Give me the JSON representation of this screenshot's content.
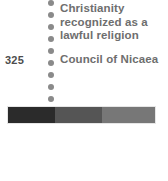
{
  "figure": {
    "type": "timeline-fragment",
    "background_color": "#ffffff",
    "width": 168,
    "height": 181
  },
  "axis": {
    "name": "dotted-timeline-axis",
    "dot_color": "#8a8a8a",
    "dot_count": 10,
    "dot_spacing_px": 12,
    "x_px": 48,
    "orientation": "vertical"
  },
  "events": [
    {
      "year": "",
      "text": "",
      "clipped": true,
      "note": "top line cut off by crop"
    },
    {
      "year": "",
      "text": "Christianity recognized as a lawful religion",
      "lines": [
        "Christianity",
        "recognized as a",
        "lawful religion"
      ],
      "clipped": false
    },
    {
      "year": "325",
      "text": "Council of Nicaea",
      "lines": [
        "Council of Nicaea"
      ],
      "clipped": false
    }
  ],
  "year_labels": [
    {
      "value": "325",
      "top_px": 54
    }
  ],
  "era_bar": {
    "name": "era-band",
    "segments": [
      {
        "label": "",
        "color": "#2b2b2b",
        "width_pct": 32
      },
      {
        "label": "",
        "color": "#555555",
        "width_pct": 32
      },
      {
        "label": "",
        "color": "#777777",
        "width_pct": 36
      }
    ],
    "border_color": "#e6e6e6"
  },
  "colors": {
    "text_primary": "#6e6e6e",
    "text_year": "#4d4d4d",
    "text_clipped": "#9d9d9d",
    "dot": "#8a8a8a",
    "bar_dark": "#2b2b2b",
    "bar_mid": "#555555",
    "bar_light": "#777777",
    "background": "#ffffff"
  }
}
